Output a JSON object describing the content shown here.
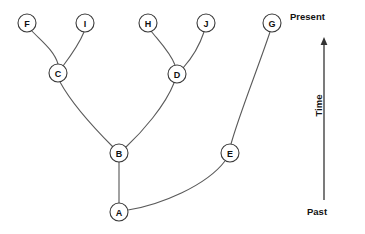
{
  "diagram": {
    "type": "phylogenetic-tree",
    "title": "",
    "background_color": "#ffffff",
    "branch_color": "#5a5a5a",
    "node_fill": "#ffffff",
    "node_stroke": "#3a3a3a",
    "node_radius": 9,
    "nodes": [
      {
        "id": "F",
        "label": "F",
        "x": 27,
        "y": 23,
        "kind": "tip"
      },
      {
        "id": "I",
        "label": "I",
        "x": 85,
        "y": 23,
        "kind": "tip"
      },
      {
        "id": "H",
        "label": "H",
        "x": 148,
        "y": 23,
        "kind": "tip"
      },
      {
        "id": "J",
        "label": "J",
        "x": 206,
        "y": 23,
        "kind": "tip"
      },
      {
        "id": "G",
        "label": "G",
        "x": 272,
        "y": 23,
        "kind": "tip"
      },
      {
        "id": "C",
        "label": "C",
        "x": 58,
        "y": 73,
        "kind": "internal"
      },
      {
        "id": "D",
        "label": "D",
        "x": 177,
        "y": 74,
        "kind": "internal"
      },
      {
        "id": "B",
        "label": "B",
        "x": 119,
        "y": 153,
        "kind": "internal"
      },
      {
        "id": "E",
        "label": "E",
        "x": 230,
        "y": 153,
        "kind": "internal"
      },
      {
        "id": "A",
        "label": "A",
        "x": 119,
        "y": 212,
        "kind": "root"
      }
    ],
    "edges": [
      {
        "id": "edge-c-f",
        "from": "C",
        "to": "F",
        "path": "M 58 64 C 54 50 40 40 31 30",
        "style": "curved"
      },
      {
        "id": "edge-c-i",
        "from": "C",
        "to": "I",
        "path": "M 63 66 C 72 54 80 42 84 32",
        "style": "curved"
      },
      {
        "id": "edge-d-h",
        "from": "D",
        "to": "H",
        "path": "M 175 65 C 170 52 158 40 151 31",
        "style": "curved"
      },
      {
        "id": "edge-d-j",
        "from": "D",
        "to": "J",
        "path": "M 183 68 C 192 58 200 44 204 32",
        "style": "curved"
      },
      {
        "id": "edge-b-c",
        "from": "B",
        "to": "C",
        "path": "M 113 147 C 96 130 72 104 60 82",
        "style": "curved"
      },
      {
        "id": "edge-b-d",
        "from": "B",
        "to": "D",
        "path": "M 126 147 C 142 132 165 106 174 83",
        "style": "curved"
      },
      {
        "id": "edge-a-b",
        "from": "A",
        "to": "B",
        "path": "M 119 203 L 119 162",
        "style": "straight"
      },
      {
        "id": "edge-a-e",
        "from": "A",
        "to": "E",
        "path": "M 128 210 C 160 205 206 186 225 161",
        "style": "curved"
      },
      {
        "id": "edge-e-g",
        "from": "E",
        "to": "G",
        "path": "M 231 144 C 239 115 258 68 270 32",
        "style": "curved"
      }
    ]
  },
  "axis": {
    "name": "time-axis",
    "present_label": "Present",
    "past_label": "Past",
    "time_label": "Time",
    "direction": "upward",
    "line": {
      "x": 324,
      "y_top": 37,
      "y_bottom": 200
    },
    "color": "#333333"
  }
}
